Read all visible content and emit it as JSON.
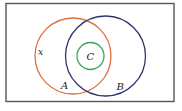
{
  "diagram": {
    "type": "venn",
    "universe": {
      "x": 6,
      "y": 3.5,
      "width": 168,
      "height": 98,
      "stroke": "#555555"
    },
    "sets": [
      {
        "name": "A",
        "cx": 73,
        "cy": 56,
        "r": 38,
        "stroke": "#e07040"
      },
      {
        "name": "B",
        "cx": 105.5,
        "cy": 56,
        "r": 40,
        "stroke": "#33336e"
      },
      {
        "name": "C",
        "cx": 90.5,
        "cy": 56,
        "r": 13.5,
        "stroke": "#40a060"
      }
    ],
    "labels": {
      "a": "A",
      "b": "B",
      "c": "C",
      "x": "x"
    },
    "relations": [
      "C is a subset of A ∩ B",
      "A and B overlap",
      "x lies in A only"
    ]
  }
}
